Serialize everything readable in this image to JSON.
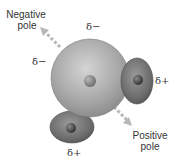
{
  "diagram": {
    "labels": {
      "negative_pole_line1": "Negative",
      "negative_pole_line2": "pole",
      "positive_pole_line1": "Positive",
      "positive_pole_line2": "pole"
    },
    "charges": {
      "top": "δ−",
      "left": "δ−",
      "right": "δ+",
      "bottom": "δ+"
    },
    "colors": {
      "oxygen": "#a8a8a8",
      "hydrogen": "#6e6e6e",
      "arrow": "#b8b8b8",
      "text": "#333333"
    }
  }
}
